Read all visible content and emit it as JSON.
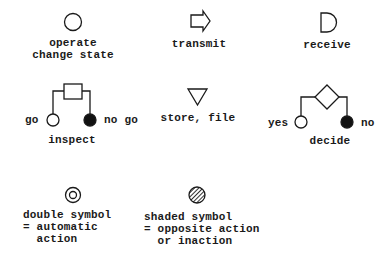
{
  "symbols": {
    "operate": {
      "line1": "operate",
      "line2": "change state"
    },
    "transmit": {
      "label": "transmit"
    },
    "receive": {
      "label": "receive"
    },
    "inspect": {
      "label": "inspect",
      "left": "go",
      "right": "no go"
    },
    "store": {
      "label": "store, file"
    },
    "decide": {
      "label": "decide",
      "left": "yes",
      "right": "no"
    },
    "double": {
      "line1": "double symbol",
      "line2": "= automatic",
      "line3": "  action"
    },
    "shaded": {
      "line1": "shaded symbol",
      "line2": "= opposite action",
      "line3": "  or inaction"
    }
  },
  "colors": {
    "ink": "#1a1a1a",
    "background": "#ffffff"
  }
}
